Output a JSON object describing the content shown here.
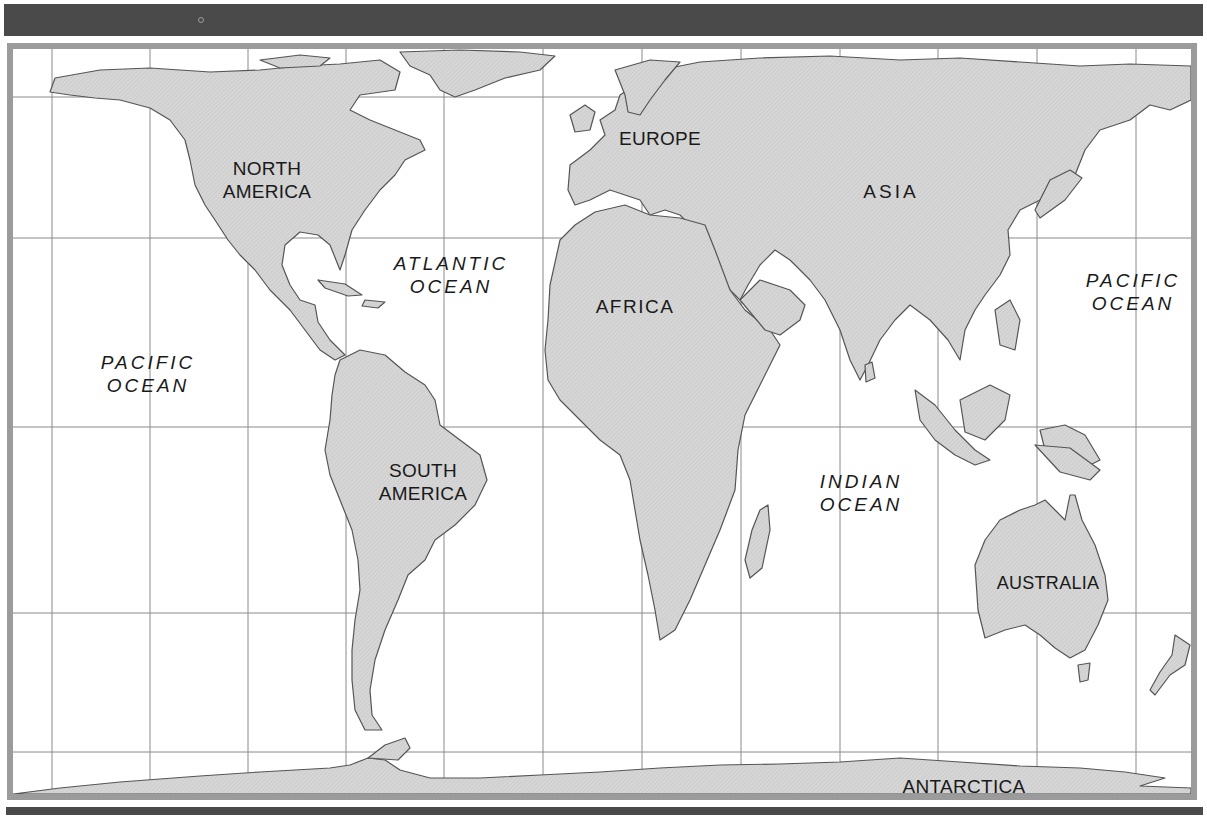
{
  "map": {
    "colors": {
      "land": "#d3d3d3",
      "coast": "#555555",
      "water": "#ffffff",
      "grid": "#8a8a8a",
      "frame": "#9b9b9b",
      "bars": "#4a4a4a",
      "text": "#1a1a1a"
    },
    "grid": {
      "verticals_x": [
        52,
        150,
        248,
        346,
        444,
        543,
        642,
        741,
        840,
        938,
        1037,
        1136
      ],
      "horizontals_y": [
        97,
        238,
        427,
        613,
        752
      ]
    },
    "continents": [
      {
        "id": "north-america",
        "line1": "NORTH",
        "line2": "AMERICA"
      },
      {
        "id": "south-america",
        "line1": "SOUTH",
        "line2": "AMERICA"
      },
      {
        "id": "europe",
        "line1": "EUROPE"
      },
      {
        "id": "asia",
        "line1": "ASIA"
      },
      {
        "id": "africa",
        "line1": "AFRICA"
      },
      {
        "id": "australia",
        "line1": "AUSTRALIA"
      },
      {
        "id": "antarctica",
        "line1": "ANTARCTICA"
      }
    ],
    "oceans": [
      {
        "id": "pacific-west",
        "line1": "PACIFIC",
        "line2": "OCEAN"
      },
      {
        "id": "atlantic",
        "line1": "ATLANTIC",
        "line2": "OCEAN"
      },
      {
        "id": "indian",
        "line1": "INDIAN",
        "line2": "OCEAN"
      },
      {
        "id": "pacific-east",
        "line1": "PACIFIC",
        "line2": "OCEAN"
      }
    ]
  }
}
